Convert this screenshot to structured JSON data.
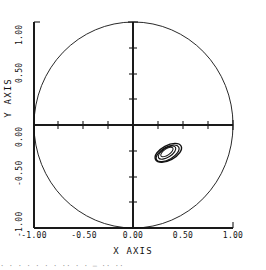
{
  "chart_data": {
    "type": "line",
    "title": "",
    "xlabel": "X AXIS",
    "ylabel": "Y AXIS",
    "xlim": [
      -1.0,
      1.0
    ],
    "ylim": [
      -1.0,
      1.0
    ],
    "grid": false,
    "legend": null,
    "x_ticks": [
      -1.0,
      -0.5,
      0.0,
      0.5,
      1.0
    ],
    "x_tick_labels": [
      "-1.00",
      "-0.50",
      "0.00",
      "0.50",
      "1.00"
    ],
    "y_ticks": [
      -1.0,
      -0.5,
      0.0,
      0.5,
      1.0
    ],
    "y_tick_labels": [
      "-1.00",
      "-0.50",
      "0.00",
      "0.50",
      "1.00"
    ],
    "minor_tick_step": 0.25,
    "series": [
      {
        "name": "unit-circle",
        "kind": "circle",
        "center": [
          0.0,
          0.0
        ],
        "radius": 1.0,
        "color": "#111111",
        "linewidth": 0.9
      },
      {
        "name": "trajectory-ellipse-outer",
        "kind": "ellipse",
        "center": [
          0.35,
          -0.27
        ],
        "semi_major": 0.145,
        "semi_minor": 0.072,
        "rotation_deg": -28,
        "color": "#111111",
        "linewidth": 1.4
      },
      {
        "name": "trajectory-ellipse-middle",
        "kind": "ellipse",
        "center": [
          0.343,
          -0.275
        ],
        "semi_major": 0.128,
        "semi_minor": 0.06,
        "rotation_deg": -30,
        "color": "#111111",
        "linewidth": 1.2
      },
      {
        "name": "trajectory-ellipse-inner",
        "kind": "ellipse",
        "center": [
          0.337,
          -0.268
        ],
        "semi_major": 0.1,
        "semi_minor": 0.045,
        "rotation_deg": -32,
        "color": "#111111",
        "linewidth": 1.1
      },
      {
        "name": "trajectory-ellipse-core",
        "kind": "ellipse",
        "center": [
          0.336,
          -0.262
        ],
        "semi_major": 0.072,
        "semi_minor": 0.03,
        "rotation_deg": -34,
        "color": "#111111",
        "linewidth": 1.0
      }
    ],
    "colors": {
      "line": "#111111",
      "axis": "#1a1a1a",
      "background": "#ffffff"
    }
  },
  "axes": {
    "x_title": "X AXIS",
    "y_title": "Y AXIS"
  },
  "x_tick_labels": [
    "-1.00",
    "-0.50",
    "0.00",
    "0.50",
    "1.00"
  ],
  "y_tick_labels": [
    "-1.00",
    "-0.50",
    "0.00",
    "0.50",
    "1.00"
  ],
  "caption": {
    "partial_line": "·  ·   · ·  ·  · ·  ·· ·    ·  —  ·· ··"
  }
}
